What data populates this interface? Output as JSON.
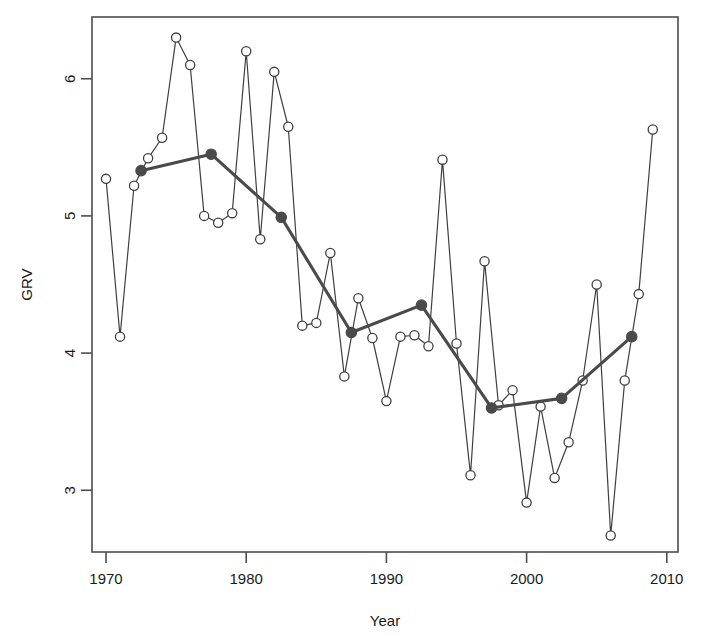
{
  "chart_data": {
    "type": "line",
    "title": "",
    "xlabel": "Year",
    "ylabel": "GRV",
    "xlim": [
      1969.0,
      2010.8
    ],
    "ylim": [
      2.55,
      6.45
    ],
    "xticks": [
      1970,
      1980,
      1990,
      2000,
      2010
    ],
    "xtick_labels": [
      "1970",
      "1980",
      "1990",
      "2000",
      "2010"
    ],
    "yticks": [
      3,
      4,
      5,
      6
    ],
    "ytick_labels": [
      "3",
      "4",
      "5",
      "6"
    ],
    "grid": false,
    "legend": "none",
    "series": [
      {
        "name": "annual-grv",
        "style": "thin-line-open-circles",
        "color": "#3f3f3f",
        "marker": "open-circle",
        "x": [
          1970,
          1971,
          1972,
          1973,
          1974,
          1975,
          1976,
          1977,
          1978,
          1979,
          1980,
          1981,
          1982,
          1983,
          1984,
          1985,
          1986,
          1987,
          1988,
          1989,
          1990,
          1991,
          1992,
          1993,
          1994,
          1995,
          1996,
          1997,
          1998,
          1999,
          2000,
          2001,
          2002,
          2003,
          2004,
          2005,
          2006,
          2007,
          2008,
          2009
        ],
        "values": [
          5.27,
          4.12,
          5.22,
          5.42,
          5.57,
          6.3,
          6.1,
          5.0,
          4.95,
          5.02,
          6.2,
          4.83,
          6.05,
          5.65,
          4.2,
          4.22,
          4.73,
          3.83,
          4.4,
          4.11,
          3.65,
          4.12,
          4.13,
          4.05,
          5.41,
          4.07,
          3.11,
          4.67,
          3.62,
          3.73,
          2.91,
          3.61,
          3.09,
          3.35,
          3.8,
          4.5,
          2.67,
          3.8,
          4.43,
          5.63
        ]
      },
      {
        "name": "five-year-smoothed-mean",
        "style": "thick-line-filled-circles",
        "color": "#4a4a4a",
        "marker": "filled-circle",
        "x": [
          1972.5,
          1977.5,
          1982.5,
          1987.5,
          1992.5,
          1997.5,
          2002.5,
          2007.5
        ],
        "values": [
          5.33,
          5.45,
          4.99,
          4.15,
          4.35,
          3.6,
          3.67,
          4.12
        ]
      }
    ]
  },
  "axes": {
    "x_label": "Year",
    "y_label": "GRV"
  }
}
